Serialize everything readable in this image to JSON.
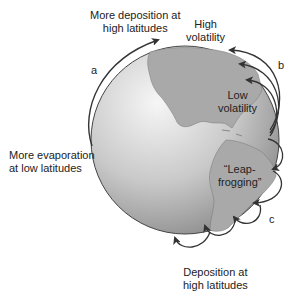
{
  "diagram": {
    "labels": {
      "more_deposition_line1": "More deposition at",
      "more_deposition_line2": "high latitudes",
      "high_volatility_line1": "High",
      "high_volatility_line2": "volatility",
      "low_volatility_line1": "Low",
      "low_volatility_line2": "volatility",
      "more_evaporation_line1": "More evaporation",
      "more_evaporation_line2": "at low latitudes",
      "leapfrogging_line1": "“Leap-",
      "leapfrogging_line2": "frogging”",
      "deposition_line1": "Deposition at",
      "deposition_line2": "high latitudes"
    },
    "path_letters": {
      "a": "a",
      "b": "b",
      "c": "c"
    },
    "colors": {
      "globe_light": "#f2f2f2",
      "globe_dark": "#8a8a8a",
      "land": "#a8a8a8",
      "arrow": "#333333"
    }
  }
}
